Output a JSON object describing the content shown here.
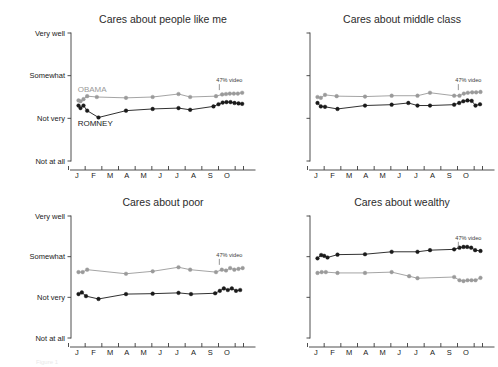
{
  "figure": {
    "caption_fragment": "Figure 1",
    "annotation_label": "47% video",
    "series_labels": {
      "obama": "OBAMA",
      "romney": "ROMNEY"
    },
    "colors": {
      "obama": "#9a9a9a",
      "romney": "#1a1a1a",
      "axis": "#3b3b3b",
      "text": "#1a1a1a",
      "title": "#2b2b2b"
    }
  },
  "chart_data": [
    {
      "type": "line",
      "panel": "top-left",
      "title": "Cares about people like me",
      "xlabel": "",
      "ylabel": "",
      "ylim": [
        0,
        3
      ],
      "ytick_labels": [
        "Not at all",
        "Not very",
        "Somewhat",
        "Very well"
      ],
      "ytick_values": [
        0,
        1,
        2,
        3
      ],
      "xtick_labels": [
        "J",
        "F",
        "M",
        "A",
        "M",
        "J",
        "J",
        "A",
        "S",
        "O"
      ],
      "grid": false,
      "legend_position": "inline-annotation",
      "annotation": {
        "label": "47% video",
        "x": 8.55
      },
      "series": [
        {
          "name": "OBAMA",
          "color": "#9a9a9a",
          "x": [
            0.1,
            0.22,
            0.4,
            0.62,
            1.2,
            2.95,
            4.55,
            6.1,
            6.8,
            8.35,
            8.72,
            8.95,
            9.18,
            9.42,
            9.66,
            9.92
          ],
          "values": [
            1.42,
            1.4,
            1.45,
            1.52,
            1.5,
            1.48,
            1.5,
            1.57,
            1.5,
            1.52,
            1.56,
            1.57,
            1.58,
            1.58,
            1.58,
            1.6
          ]
        },
        {
          "name": "ROMNEY",
          "color": "#1a1a1a",
          "x": [
            0.1,
            0.22,
            0.4,
            0.62,
            1.3,
            2.95,
            4.55,
            6.1,
            6.8,
            8.2,
            8.5,
            8.75,
            8.98,
            9.22,
            9.46,
            9.7,
            9.92
          ],
          "values": [
            1.3,
            1.24,
            1.3,
            1.18,
            1.02,
            1.18,
            1.22,
            1.24,
            1.2,
            1.28,
            1.33,
            1.37,
            1.38,
            1.38,
            1.36,
            1.35,
            1.34
          ]
        }
      ]
    },
    {
      "type": "line",
      "panel": "top-right",
      "title": "Cares about middle class",
      "xlabel": "",
      "ylabel": "",
      "ylim": [
        0,
        3
      ],
      "ytick_labels": [
        "Not at all",
        "Not very",
        "Somewhat",
        "Very well"
      ],
      "ytick_values": [
        0,
        1,
        2,
        3
      ],
      "xtick_labels": [
        "J",
        "F",
        "M",
        "A",
        "M",
        "J",
        "J",
        "A",
        "S",
        "O"
      ],
      "grid": false,
      "legend_position": "inline-annotation",
      "annotation": {
        "label": "47% video",
        "x": 8.55
      },
      "series": [
        {
          "name": "OBAMA",
          "color": "#9a9a9a",
          "x": [
            0.1,
            0.3,
            0.55,
            1.25,
            2.95,
            4.55,
            6.1,
            6.85,
            8.3,
            8.62,
            8.88,
            9.12,
            9.38,
            9.62,
            9.88
          ],
          "values": [
            1.5,
            1.48,
            1.55,
            1.52,
            1.51,
            1.53,
            1.53,
            1.6,
            1.53,
            1.53,
            1.58,
            1.6,
            1.61,
            1.61,
            1.62
          ]
        },
        {
          "name": "ROMNEY",
          "color": "#1a1a1a",
          "x": [
            0.1,
            0.3,
            0.55,
            1.3,
            2.95,
            4.55,
            5.55,
            6.1,
            6.85,
            8.3,
            8.6,
            8.85,
            9.1,
            9.35,
            9.58,
            9.85
          ],
          "values": [
            1.36,
            1.28,
            1.27,
            1.22,
            1.3,
            1.32,
            1.36,
            1.3,
            1.3,
            1.32,
            1.36,
            1.4,
            1.42,
            1.41,
            1.3,
            1.33
          ]
        }
      ]
    },
    {
      "type": "line",
      "panel": "bottom-left",
      "title": "Cares about poor",
      "xlabel": "",
      "ylabel": "",
      "ylim": [
        0,
        3
      ],
      "ytick_labels": [
        "Not at all",
        "Not very",
        "Somewhat",
        "Very well"
      ],
      "ytick_values": [
        0,
        1,
        2,
        3
      ],
      "xtick_labels": [
        "J",
        "F",
        "M",
        "A",
        "M",
        "J",
        "J",
        "A",
        "S",
        "O"
      ],
      "grid": false,
      "legend_position": "inline-annotation",
      "annotation": {
        "label": "47% video",
        "x": 8.55
      },
      "series": [
        {
          "name": "OBAMA",
          "color": "#9a9a9a",
          "x": [
            0.1,
            0.35,
            0.62,
            2.95,
            4.55,
            6.1,
            6.8,
            8.35,
            8.7,
            8.95,
            9.2,
            9.45,
            9.7,
            9.95
          ],
          "values": [
            1.62,
            1.62,
            1.68,
            1.58,
            1.64,
            1.74,
            1.68,
            1.62,
            1.68,
            1.66,
            1.72,
            1.68,
            1.7,
            1.72
          ]
        },
        {
          "name": "ROMNEY",
          "color": "#1a1a1a",
          "x": [
            0.1,
            0.3,
            0.55,
            1.3,
            2.95,
            4.55,
            6.1,
            6.85,
            8.3,
            8.58,
            8.82,
            9.06,
            9.3,
            9.55,
            9.8
          ],
          "values": [
            1.08,
            1.12,
            1.03,
            0.96,
            1.08,
            1.09,
            1.11,
            1.08,
            1.1,
            1.16,
            1.22,
            1.18,
            1.22,
            1.16,
            1.18
          ]
        }
      ]
    },
    {
      "type": "line",
      "panel": "bottom-right",
      "title": "Cares about wealthy",
      "xlabel": "",
      "ylabel": "",
      "ylim": [
        0,
        3
      ],
      "ytick_labels": [
        "Not at all",
        "Not very",
        "Somewhat",
        "Very well"
      ],
      "ytick_values": [
        0,
        1,
        2,
        3
      ],
      "xtick_labels": [
        "J",
        "F",
        "M",
        "A",
        "M",
        "J",
        "J",
        "A",
        "S",
        "O"
      ],
      "grid": false,
      "legend_position": "inline-annotation",
      "annotation": {
        "label": "47% video",
        "x": 8.55
      },
      "series": [
        {
          "name": "ROMNEY",
          "color": "#1a1a1a",
          "x": [
            0.1,
            0.32,
            0.5,
            0.7,
            1.3,
            2.95,
            4.55,
            6.1,
            6.85,
            8.3,
            8.62,
            8.86,
            9.08,
            9.32,
            9.56,
            9.88
          ],
          "values": [
            1.96,
            2.04,
            2.02,
            1.98,
            2.05,
            2.06,
            2.12,
            2.12,
            2.16,
            2.18,
            2.22,
            2.24,
            2.24,
            2.22,
            2.16,
            2.14
          ]
        },
        {
          "name": "OBAMA",
          "color": "#9a9a9a",
          "x": [
            0.1,
            0.35,
            0.6,
            1.3,
            2.95,
            4.55,
            5.6,
            6.1,
            8.3,
            8.62,
            8.86,
            9.1,
            9.34,
            9.58,
            9.88
          ],
          "values": [
            1.6,
            1.62,
            1.62,
            1.6,
            1.6,
            1.62,
            1.52,
            1.47,
            1.5,
            1.42,
            1.4,
            1.42,
            1.42,
            1.42,
            1.48
          ]
        }
      ]
    }
  ]
}
